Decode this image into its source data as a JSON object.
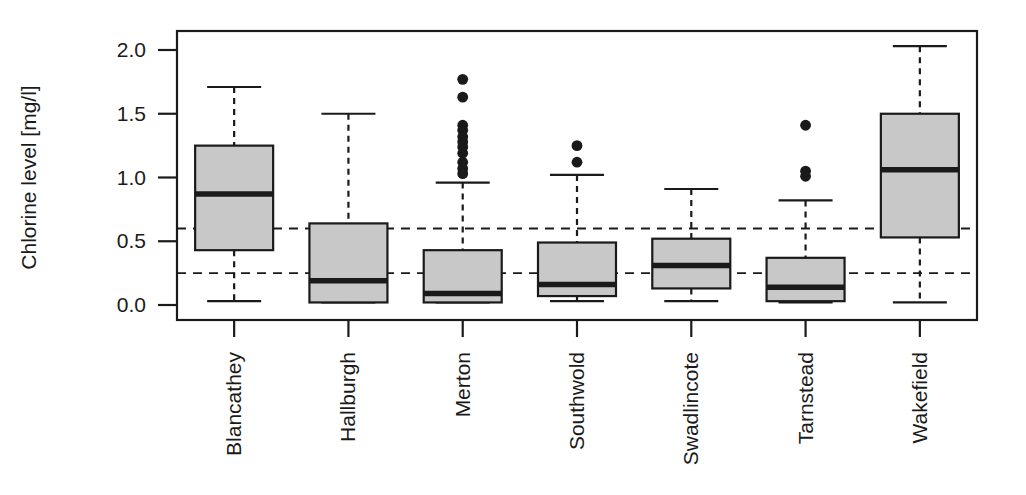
{
  "chart_data": {
    "type": "box",
    "title": "",
    "subtitle": "",
    "xlabel": "",
    "ylabel": "Chlorine level [mg/l]",
    "categories": [
      "Blancathey",
      "Hallburgh",
      "Merton",
      "Southwold",
      "Swadlincote",
      "Tarnstead",
      "Wakefield"
    ],
    "ylim": [
      -0.06,
      2.12
    ],
    "yticks": [
      0.0,
      0.5,
      1.0,
      1.5,
      2.0
    ],
    "ytick_labels": [
      "0.0",
      "0.5",
      "1.0",
      "1.5",
      "2.0"
    ],
    "grid": false,
    "legend": null,
    "reference_lines": [
      {
        "value": 0.6,
        "style": "dashed",
        "label": ""
      },
      {
        "value": 0.25,
        "style": "dashed",
        "label": ""
      }
    ],
    "box_fill_color": "#c8c8c8",
    "line_color": "#1a1a1a",
    "boxes": [
      {
        "name": "Blancathey",
        "whisker_low": 0.03,
        "q1": 0.43,
        "median": 0.87,
        "q3": 1.25,
        "whisker_high": 1.71,
        "outliers": []
      },
      {
        "name": "Hallburgh",
        "whisker_low": 0.02,
        "q1": 0.02,
        "median": 0.19,
        "q3": 0.64,
        "whisker_high": 1.5,
        "outliers": []
      },
      {
        "name": "Merton",
        "whisker_low": 0.02,
        "q1": 0.02,
        "median": 0.09,
        "q3": 0.43,
        "whisker_high": 0.96,
        "outliers": [
          1.77,
          1.63,
          1.41,
          1.37,
          1.32,
          1.28,
          1.24,
          1.19,
          1.12,
          1.07,
          1.03
        ]
      },
      {
        "name": "Southwold",
        "whisker_low": 0.03,
        "q1": 0.07,
        "median": 0.16,
        "q3": 0.49,
        "whisker_high": 1.02,
        "outliers": [
          1.25,
          1.12
        ]
      },
      {
        "name": "Swadlincote",
        "whisker_low": 0.03,
        "q1": 0.13,
        "median": 0.31,
        "q3": 0.52,
        "whisker_high": 0.91,
        "outliers": []
      },
      {
        "name": "Tarnstead",
        "whisker_low": 0.02,
        "q1": 0.03,
        "median": 0.14,
        "q3": 0.37,
        "whisker_high": 0.82,
        "outliers": [
          1.41,
          1.05,
          1.01
        ]
      },
      {
        "name": "Wakefield",
        "whisker_low": 0.02,
        "q1": 0.53,
        "median": 1.06,
        "q3": 1.5,
        "whisker_high": 2.03,
        "outliers": []
      }
    ]
  },
  "axis_label": {
    "y": "Chlorine level [mg/l]"
  }
}
